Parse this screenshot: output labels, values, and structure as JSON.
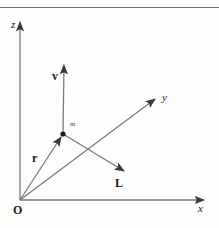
{
  "figure": {
    "background_color": "#fdfdfc",
    "line_color": "#7a7a7a",
    "label_color": "#1b1b1b",
    "width": 219,
    "height": 228
  },
  "axes": [
    {
      "name": "z-axis",
      "label": "z",
      "style": "italic",
      "from": [
        20,
        200
      ],
      "to": [
        20,
        20
      ]
    },
    {
      "name": "x-axis",
      "label": "x",
      "style": "italic",
      "from": [
        20,
        200
      ],
      "to": [
        207,
        200
      ]
    },
    {
      "name": "y-axis",
      "label": "y",
      "style": "italic",
      "from": [
        20,
        200
      ],
      "to": [
        158,
        97
      ]
    }
  ],
  "origin": {
    "label": "O",
    "style": "bold",
    "position": [
      20,
      200
    ]
  },
  "point_mass": {
    "label": "m",
    "style": "italic",
    "position": [
      63,
      134
    ]
  },
  "vectors": [
    {
      "name": "position-vector",
      "label": "r",
      "style": "bold",
      "from": [
        20,
        200
      ],
      "to": [
        63,
        134
      ]
    },
    {
      "name": "velocity-vector",
      "label": "v",
      "style": "bold",
      "from": [
        63,
        134
      ],
      "to": [
        64,
        62
      ]
    },
    {
      "name": "angular-momentum-vector",
      "label": "L",
      "style": "bold",
      "from": [
        63,
        134
      ],
      "to": [
        127,
        173
      ]
    }
  ],
  "rules": [
    {
      "name": "top-rule",
      "y": 7,
      "color": "#6f6f6f"
    }
  ]
}
